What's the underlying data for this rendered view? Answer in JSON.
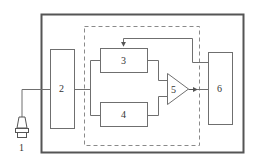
{
  "diagram": {
    "type": "block-diagram",
    "colors": {
      "line": "#6f6f6f",
      "outer_border": "#555555",
      "text": "#333333",
      "background": "#ffffff"
    },
    "labels": {
      "sensor": "1",
      "block2": "2",
      "block3": "3",
      "block4": "4",
      "amplifier": "5",
      "block6": "6"
    },
    "components": [
      {
        "id": "1",
        "kind": "sensor-probe"
      },
      {
        "id": "2",
        "kind": "block"
      },
      {
        "id": "3",
        "kind": "block"
      },
      {
        "id": "4",
        "kind": "block"
      },
      {
        "id": "5",
        "kind": "amplifier-triangle"
      },
      {
        "id": "6",
        "kind": "block"
      }
    ],
    "connections": [
      {
        "from": "1",
        "to": "2"
      },
      {
        "from": "2",
        "to": "3"
      },
      {
        "from": "2",
        "to": "4"
      },
      {
        "from": "3",
        "to": "5"
      },
      {
        "from": "4",
        "to": "5"
      },
      {
        "from": "5",
        "to": "6",
        "arrow": true
      },
      {
        "from": "6",
        "to": "3",
        "arrow": true,
        "feedback": true
      }
    ],
    "groups": [
      {
        "kind": "outer-solid-enclosure",
        "contains": [
          "2",
          "3",
          "4",
          "5",
          "6"
        ]
      },
      {
        "kind": "dashed-enclosure",
        "contains": [
          "3",
          "4",
          "5"
        ]
      }
    ]
  }
}
